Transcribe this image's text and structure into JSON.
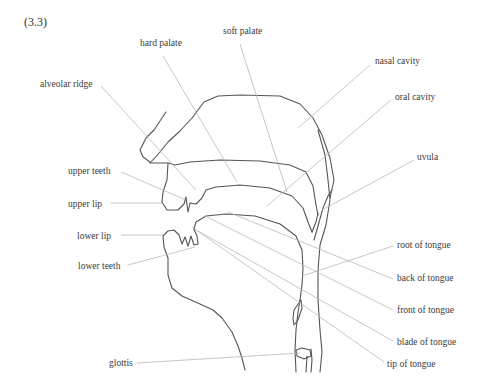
{
  "figure": {
    "number": "(3.3)",
    "type": "mid-sagittal diagram of the vocal tract",
    "labels": {
      "hard_palate": "hard palate",
      "soft_palate": "soft palate",
      "nasal_cavity": "nasal cavity",
      "oral_cavity": "oral cavity",
      "alveolar_ridge": "alveolar ridge",
      "uvula": "uvula",
      "upper_teeth": "upper teeth",
      "upper_lip": "upper lip",
      "lower_lip": "lower lip",
      "lower_teeth": "lower teeth",
      "root_of_tongue": "root of tongue",
      "back_of_tongue": "back of tongue",
      "front_of_tongue": "front of tongue",
      "blade_of_tongue": "blade of tongue",
      "tip_of_tongue": "tip of tongue",
      "glottis": "glottis"
    }
  },
  "colors": {
    "background": "#ffffff",
    "outline": "#555555",
    "leader_line": "#b8b8b8",
    "text": "#3a3a3a"
  }
}
